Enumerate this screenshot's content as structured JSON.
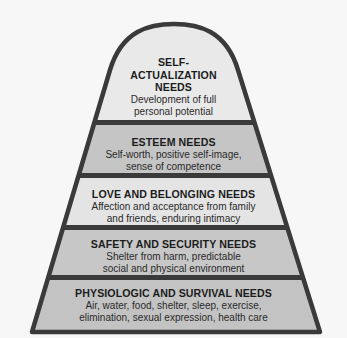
{
  "diagram": {
    "type": "pyramid",
    "colors": {
      "border": "#3a3a3a",
      "light_fill": "#e9e9e9",
      "dark_fill": "#c5c5c5",
      "background": "#f7f7f7"
    },
    "levels": [
      {
        "title_lines": [
          "SELF-",
          "ACTUALIZATION",
          "NEEDS"
        ],
        "desc_lines": [
          "Development of full",
          "personal potential"
        ]
      },
      {
        "title": "ESTEEM NEEDS",
        "desc_lines": [
          "Self-worth, positive self-image,",
          "sense of competence"
        ]
      },
      {
        "title": "LOVE AND BELONGING NEEDS",
        "desc_lines": [
          "Affection and acceptance from family",
          "and friends, enduring intimacy"
        ]
      },
      {
        "title": "SAFETY AND SECURITY NEEDS",
        "desc_lines": [
          "Shelter from harm, predictable",
          "social and physical environment"
        ]
      },
      {
        "title": "PHYSIOLOGIC AND SURVIVAL NEEDS",
        "desc_lines": [
          "Air, water, food, shelter, sleep, exercise,",
          "elimination, sexual expression, health care"
        ]
      }
    ]
  }
}
